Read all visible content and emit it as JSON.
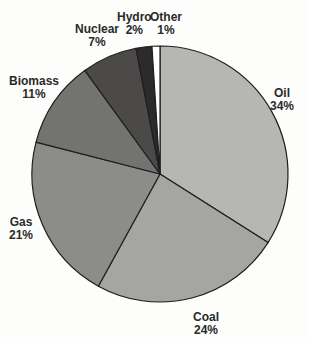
{
  "chart_data": {
    "type": "pie",
    "title": "",
    "start_angle_deg": 0,
    "direction": "clockwise",
    "categories": [
      "Oil",
      "Coal",
      "Gas",
      "Biomass",
      "Nuclear",
      "Hydro",
      "Other"
    ],
    "values": [
      34,
      24,
      21,
      11,
      7,
      2,
      1
    ],
    "value_labels": [
      "34%",
      "24%",
      "21%",
      "11%",
      "7%",
      "2%",
      "1%"
    ],
    "colors": [
      "#b6b6b4",
      "#a5a5a3",
      "#8c8c8a",
      "#737371",
      "#4c4a49",
      "#2c2a2a",
      "#ffffff"
    ],
    "unit": "%"
  },
  "labels": [
    {
      "name": "Oil",
      "pct": "34%"
    },
    {
      "name": "Coal",
      "pct": "24%"
    },
    {
      "name": "Gas",
      "pct": "21%"
    },
    {
      "name": "Biomass",
      "pct": "11%"
    },
    {
      "name": "Nuclear",
      "pct": "7%"
    },
    {
      "name": "Hydro",
      "pct": "2%"
    },
    {
      "name": "Other",
      "pct": "1%"
    }
  ]
}
